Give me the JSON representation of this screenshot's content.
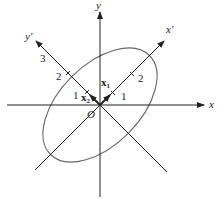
{
  "diagram": {
    "type": "rotated-axes-ellipse",
    "axes": {
      "x": {
        "label": "x"
      },
      "y": {
        "label": "y"
      },
      "x_prime": {
        "label": "x′"
      },
      "y_prime": {
        "label": "y′"
      }
    },
    "origin": {
      "label": "O"
    },
    "vectors": {
      "x1": {
        "label": "x",
        "subscript": "1"
      },
      "x2": {
        "label": "x",
        "subscript": "2"
      }
    },
    "ticks": {
      "x_prime": [
        "1",
        "2"
      ],
      "y_prime": [
        "1",
        "2",
        "3"
      ]
    },
    "colors": {
      "axis": "#222222",
      "ellipse": "#666666"
    }
  }
}
